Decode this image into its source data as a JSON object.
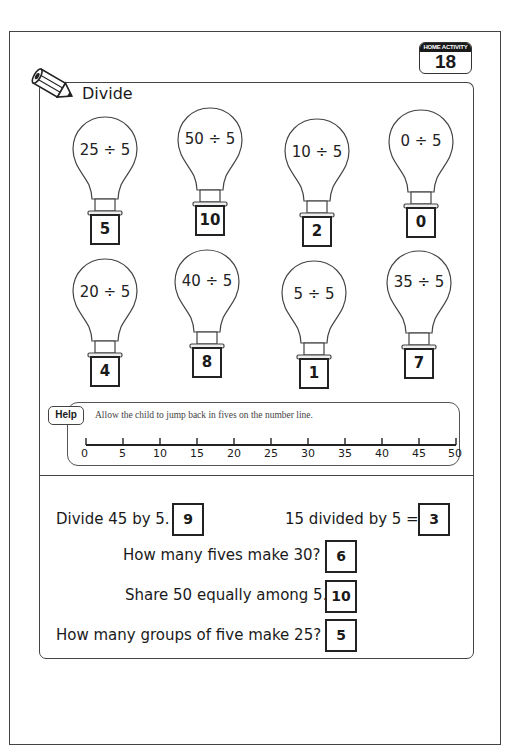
{
  "badge": {
    "label": "HOME ACTIVITY",
    "number": "18"
  },
  "activity": {
    "title": "Divide",
    "icon": "pencil-icon",
    "bulbs": [
      {
        "expression": "25 ÷ 5",
        "answer": "5"
      },
      {
        "expression": "50 ÷ 5",
        "answer": "10"
      },
      {
        "expression": "10 ÷ 5",
        "answer": "2"
      },
      {
        "expression": "0 ÷ 5",
        "answer": "0"
      },
      {
        "expression": "20 ÷ 5",
        "answer": "4"
      },
      {
        "expression": "40 ÷ 5",
        "answer": "8"
      },
      {
        "expression": "5 ÷ 5",
        "answer": "1"
      },
      {
        "expression": "35 ÷ 5",
        "answer": "7"
      }
    ]
  },
  "help": {
    "tag": "Help",
    "text": "Allow the child to jump back in fives on the number line.",
    "number_line": [
      "0",
      "5",
      "10",
      "15",
      "20",
      "25",
      "30",
      "35",
      "40",
      "45",
      "50"
    ]
  },
  "questions": [
    {
      "text": "Divide 45 by 5.",
      "answer": "9"
    },
    {
      "text": "15 divided by 5 =",
      "answer": "3"
    },
    {
      "text": "How many fives make 30?",
      "answer": "6"
    },
    {
      "text": "Share 50 equally among 5.",
      "answer": "10"
    },
    {
      "text": "How many groups of five make 25?",
      "answer": "5"
    }
  ]
}
